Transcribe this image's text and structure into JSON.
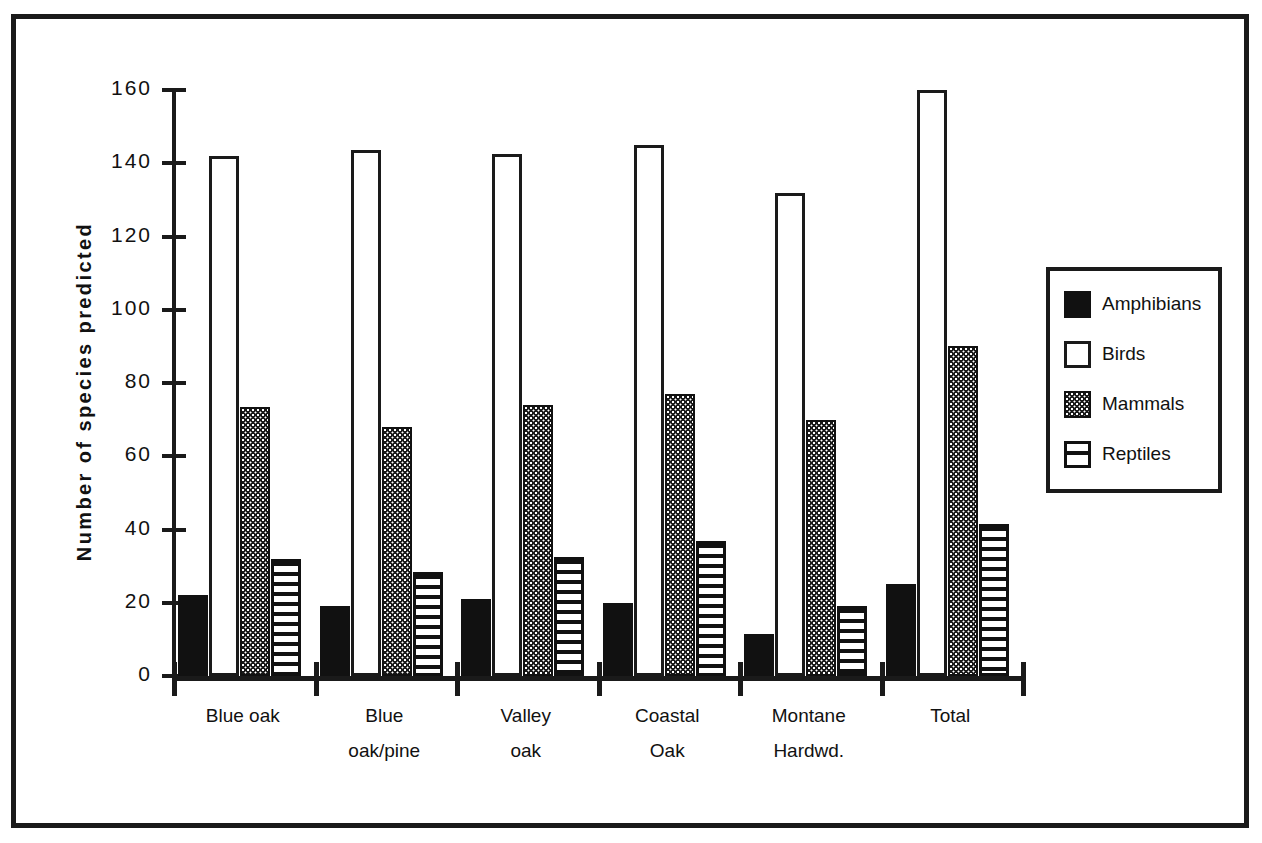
{
  "chart_data": {
    "type": "bar",
    "title": "",
    "xlabel": "",
    "ylabel": "Number of species predicted",
    "ylim": [
      0,
      160
    ],
    "ytick_values": [
      0,
      20,
      40,
      60,
      80,
      100,
      120,
      140,
      160
    ],
    "ytick_labels": [
      "0",
      "20",
      "40",
      "60",
      "80",
      "100",
      "120",
      "140",
      "160"
    ],
    "grid": false,
    "legend_position": "right",
    "categories": [
      "Blue oak",
      "Blue oak/pine",
      "Valley oak",
      "Coastal Oak",
      "Montane Hardwd.",
      "Total"
    ],
    "category_label_lines": [
      [
        "Blue oak",
        ""
      ],
      [
        "Blue",
        "oak/pine"
      ],
      [
        "Valley",
        "oak"
      ],
      [
        "Coastal",
        "Oak"
      ],
      [
        "Montane",
        "Hardwd."
      ],
      [
        "Total",
        ""
      ]
    ],
    "series": [
      {
        "name": "Amphibians",
        "fill": "solid-black",
        "values": [
          22,
          19,
          21,
          20,
          11.5,
          25
        ]
      },
      {
        "name": "Birds",
        "fill": "open-white",
        "values": [
          142,
          143.5,
          142.5,
          145,
          132,
          160
        ]
      },
      {
        "name": "Mammals",
        "fill": "stipple-dots",
        "values": [
          73.5,
          68,
          74,
          77,
          70,
          90
        ]
      },
      {
        "name": "Reptiles",
        "fill": "horiz-stripe",
        "values": [
          32,
          28.5,
          32.5,
          37,
          19,
          41.5
        ]
      }
    ]
  },
  "legend": {
    "items": [
      {
        "label": "Amphibians",
        "swatch": "amphibians"
      },
      {
        "label": "Birds",
        "swatch": "birds"
      },
      {
        "label": "Mammals",
        "swatch": "mammals"
      },
      {
        "label": "Reptiles",
        "swatch": "reptiles"
      }
    ]
  },
  "colors": {
    "ink": "#111111",
    "frame": "#1a1a1a",
    "background": "#ffffff"
  }
}
